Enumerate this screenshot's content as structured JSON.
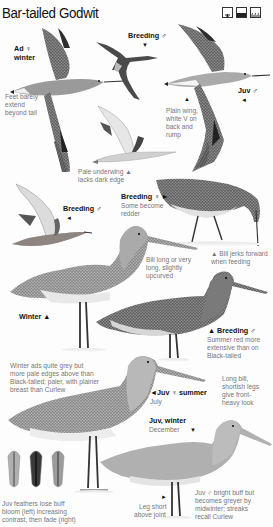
{
  "page": {
    "title": "Bar-tailed Godwit",
    "habitat_icons": [
      "tree-habitat-icon",
      "coast-habitat-icon",
      "marsh-habitat-icon"
    ],
    "colors": {
      "background": "#fdfdfd",
      "label_text": "#111111",
      "note_text": "#777777",
      "plumage_dark": "#3a3a3a",
      "plumage_mid": "#8a8a8a",
      "plumage_light": "#d8d8d8"
    }
  },
  "figures": [
    {
      "id": "ad-female-winter-flight",
      "label": "Ad ♀",
      "label2": "winter",
      "note": [
        "Feet barely",
        "extend",
        "beyond tail"
      ]
    },
    {
      "id": "breeding-male-flight",
      "label": "Breeding ♂",
      "arrow": "▼"
    },
    {
      "id": "juv-male-flight",
      "label": "Juv ♂",
      "arrow": "◄",
      "note_arrow": "▲",
      "note": [
        "Plain wing,",
        "white V on",
        "back and",
        "rump"
      ]
    },
    {
      "id": "underwing-flight",
      "note": [
        "Pale underwing ▲",
        "lacks dark edge"
      ]
    },
    {
      "id": "breeding-male-wings-raised",
      "label": "Breeding ♂",
      "arrow": "◄"
    },
    {
      "id": "breeding-female-feeding",
      "label": "Breeding ♀ ►",
      "note": [
        "Some become",
        "redder"
      ],
      "note2": [
        "▲ Bill jerks forward",
        "when feeding"
      ]
    },
    {
      "id": "winter-standing",
      "label": "Winter ▲",
      "note": [
        "Bill long or very",
        "long, slightly",
        "upcurved"
      ]
    },
    {
      "id": "breeding-male-standing",
      "label": "▲ Breeding ♂",
      "note": [
        "Summer red more",
        "extensive than on",
        "Black-tailed"
      ]
    },
    {
      "id": "juv-female-summer",
      "label": "◄Juv ♀ summer",
      "sub": "July",
      "note": [
        "Winter ads quite grey but",
        "more pale edges above than",
        "Black-tailed; paler, with plainer",
        "breast than Curlew"
      ],
      "side_note": [
        "Long bill,",
        "shortish legs",
        "give front-",
        "heavy look"
      ]
    },
    {
      "id": "juv-winter",
      "label": "Juv, winter",
      "sub": "December",
      "arrow": "▼",
      "note": [
        "Juv ♂ bright buff but",
        "becomes greyer by",
        "midwinter; streaks",
        "recall Curlew"
      ],
      "leg_note": [
        "Leg short",
        "above joint"
      ],
      "leg_arrow": "►"
    },
    {
      "id": "feather-sequence",
      "note": [
        "Juv feathers lose buff",
        "bloom (left) increasing",
        "contrast, then fade (right)"
      ]
    }
  ]
}
